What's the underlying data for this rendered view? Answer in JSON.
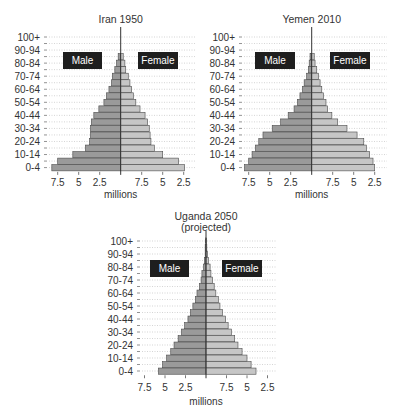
{
  "chart_data": [
    {
      "type": "bar",
      "subtype": "population-pyramid",
      "title": "Iran 1950",
      "subtitle": "",
      "xlabel": "millions",
      "ylabel": "",
      "legend": [
        "Male",
        "Female"
      ],
      "x_tick_labels_left": [
        "7.5",
        "5",
        "2.5"
      ],
      "x_tick_labels_right": [
        "7.5",
        "5",
        "2.5"
      ],
      "xlim": [
        -9,
        9
      ],
      "categories": [
        "100+",
        "95-99",
        "90-94",
        "85-89",
        "80-84",
        "75-79",
        "70-74",
        "65-69",
        "60-64",
        "55-59",
        "50-54",
        "45-49",
        "40-44",
        "35-39",
        "30-34",
        "25-29",
        "20-24",
        "15-19",
        "10-14",
        "5-9",
        "0-4"
      ],
      "y_tick_labels": [
        "100+",
        "90-94",
        "80-84",
        "70-74",
        "60-64",
        "50-54",
        "40-44",
        "30-34",
        "20-24",
        "10-14",
        "0-4"
      ],
      "series": [
        {
          "name": "Male",
          "values": [
            0,
            0,
            0,
            0.3,
            0.5,
            0.7,
            1.0,
            1.1,
            1.4,
            1.7,
            2.0,
            2.6,
            3.2,
            3.5,
            3.6,
            3.6,
            3.7,
            4.2,
            5.7,
            7.5,
            8.2
          ]
        },
        {
          "name": "Female",
          "values": [
            0,
            0,
            0,
            0.3,
            0.5,
            0.6,
            0.9,
            1.1,
            1.3,
            1.5,
            1.8,
            2.3,
            2.9,
            3.2,
            3.4,
            3.5,
            3.6,
            4.0,
            5.0,
            6.9,
            7.6
          ]
        }
      ]
    },
    {
      "type": "bar",
      "subtype": "population-pyramid",
      "title": "Yemen 2010",
      "subtitle": "",
      "xlabel": "millions",
      "ylabel": "",
      "legend": [
        "Male",
        "Female"
      ],
      "x_tick_labels_left": [
        "7.5",
        "5",
        "2.5"
      ],
      "x_tick_labels_right": [
        "7.5",
        "5",
        "2.5"
      ],
      "xlim": [
        -9,
        9
      ],
      "categories": [
        "100+",
        "95-99",
        "90-94",
        "85-89",
        "80-84",
        "75-79",
        "70-74",
        "65-69",
        "60-64",
        "55-59",
        "50-54",
        "45-49",
        "40-44",
        "35-39",
        "30-34",
        "25-29",
        "20-24",
        "15-19",
        "10-14",
        "5-9",
        "0-4"
      ],
      "y_tick_labels": [
        "100+",
        "90-94",
        "80-84",
        "70-74",
        "60-64",
        "50-54",
        "40-44",
        "30-34",
        "20-24",
        "10-14",
        "0-4"
      ],
      "series": [
        {
          "name": "Male",
          "values": [
            0,
            0,
            0,
            0.2,
            0.3,
            0.4,
            0.6,
            0.9,
            1.1,
            1.4,
            1.7,
            2.1,
            2.8,
            3.7,
            4.7,
            5.8,
            6.3,
            6.7,
            7.1,
            7.5,
            8.0
          ]
        },
        {
          "name": "Female",
          "values": [
            0,
            0,
            0,
            0.3,
            0.4,
            0.6,
            0.8,
            1.0,
            1.2,
            1.4,
            1.7,
            1.9,
            2.4,
            3.1,
            4.2,
            5.4,
            6.2,
            6.5,
            6.9,
            7.3,
            7.5
          ]
        }
      ]
    },
    {
      "type": "bar",
      "subtype": "population-pyramid",
      "title": "Uganda 2050",
      "subtitle": "(projected)",
      "xlabel": "millions",
      "ylabel": "",
      "legend": [
        "Male",
        "Female"
      ],
      "x_tick_labels_left": [
        "7.5",
        "5",
        "2.5"
      ],
      "x_tick_labels_right": [
        "7.5",
        "5",
        "2.5"
      ],
      "xlim": [
        -9,
        9
      ],
      "categories": [
        "100+",
        "95-99",
        "90-94",
        "85-89",
        "80-84",
        "75-79",
        "70-74",
        "65-69",
        "60-64",
        "55-59",
        "50-54",
        "45-49",
        "40-44",
        "35-39",
        "30-34",
        "25-29",
        "20-24",
        "15-19",
        "10-14",
        "5-9",
        "0-4"
      ],
      "y_tick_labels": [
        "100+",
        "90-94",
        "80-84",
        "70-74",
        "60-64",
        "50-54",
        "40-44",
        "30-34",
        "20-24",
        "10-14",
        "0-4"
      ],
      "series": [
        {
          "name": "Male",
          "values": [
            0.05,
            0.1,
            0.1,
            0.2,
            0.3,
            0.5,
            0.6,
            0.8,
            1.1,
            1.3,
            1.6,
            1.9,
            2.2,
            2.6,
            3.0,
            3.4,
            3.9,
            4.3,
            4.8,
            5.3,
            5.8
          ]
        },
        {
          "name": "Female",
          "values": [
            0.05,
            0.1,
            0.2,
            0.3,
            0.5,
            0.6,
            0.8,
            1.0,
            1.2,
            1.5,
            1.7,
            2.0,
            2.4,
            2.7,
            3.1,
            3.5,
            3.9,
            4.4,
            5.0,
            5.5,
            6.1
          ]
        }
      ]
    }
  ],
  "colors": {
    "male_fill": "#9a9a9a",
    "female_fill": "#c6c6c6",
    "bar_stroke": "#4a4a4a",
    "label_box": "#1e1e1e",
    "label_text": "#ffffff",
    "grid": "#b8b8b8",
    "axis": "#333333",
    "text": "#333333"
  },
  "layout": [
    {
      "center_x": 120.7,
      "px_per_m": 8.4,
      "row0_y": 37,
      "row_h": 6.53,
      "label_right_x": 40,
      "grid_left": 45,
      "grid_right": 195,
      "title_y": 23,
      "subtitle_y": null,
      "tick_y": 186,
      "xlabel_y": 198,
      "male_box": [
        63,
        52,
        39,
        17
      ],
      "female_box": [
        138,
        52,
        40,
        17
      ]
    },
    {
      "center_x": 311.7,
      "px_per_m": 8.4,
      "row0_y": 37,
      "row_h": 6.53,
      "label_right_x": 235,
      "grid_left": 240,
      "grid_right": 387,
      "title_y": 23,
      "subtitle_y": null,
      "tick_y": 186,
      "xlabel_y": 198,
      "male_box": [
        255,
        52,
        40,
        17
      ],
      "female_box": [
        330,
        52,
        40,
        17
      ]
    },
    {
      "center_x": 206,
      "px_per_m": 8.2,
      "row0_y": 241,
      "row_h": 6.5,
      "label_right_x": 133,
      "grid_left": 138,
      "grid_right": 276,
      "title_y": 220,
      "subtitle_y": 231,
      "tick_y": 391,
      "xlabel_y": 405,
      "male_box": [
        150,
        260,
        39,
        17
      ],
      "female_box": [
        222,
        260,
        40,
        17
      ]
    }
  ]
}
